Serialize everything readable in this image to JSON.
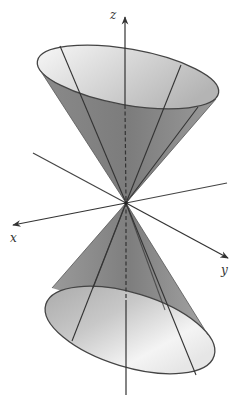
{
  "figure": {
    "colors": {
      "background": "#ffffff",
      "stroke": "#333333",
      "surface_dark": "#7a7a7a",
      "surface_mid": "#a8a8a8",
      "surface_light": "#f2f2f2"
    }
  },
  "axes": {
    "z": {
      "label": "z"
    },
    "x": {
      "label": "x"
    },
    "y": {
      "label": "y"
    }
  },
  "geometry": {
    "apex": [
      126,
      203
    ],
    "upper_ellipse": {
      "cx": 128,
      "cy": 77,
      "rx": 92,
      "ry": 28,
      "rotate": 10
    },
    "lower_ellipse": {
      "cx": 130,
      "cy": 330,
      "rx": 88,
      "ry": 37,
      "rotate": 17
    }
  }
}
